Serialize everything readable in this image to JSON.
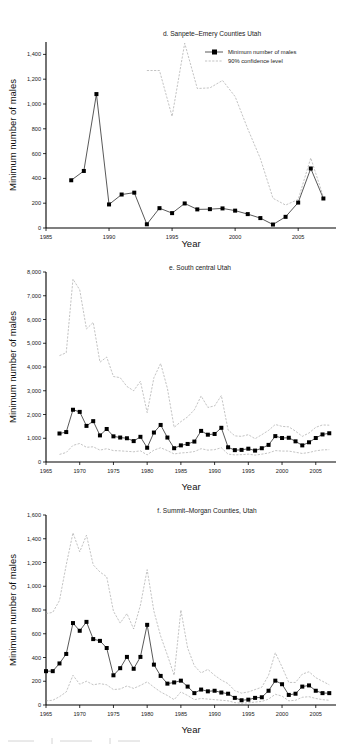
{
  "figure": {
    "panels": [
      "d",
      "e",
      "f"
    ],
    "shared_axis_label_x": "Year",
    "shared_axis_label_y": "Minimum number of males",
    "legend": {
      "series_label": "Minimum number of males",
      "ci_label": "90% confidence level"
    },
    "colors": {
      "series": "#111111",
      "confidence": "#9a9a9a",
      "axis": "#000000",
      "background": "#ffffff"
    }
  },
  "chart_data": [
    {
      "id": "panel-d",
      "type": "line",
      "title": "d. Sanpete–Emery Counties Utah",
      "xlabel": "Year",
      "ylabel": "Minimum number of males",
      "xlim": [
        1985,
        2008
      ],
      "ylim": [
        0,
        1500
      ],
      "xticks": [
        1985,
        1990,
        1995,
        2000,
        2005
      ],
      "xtick_labels": [
        "1985",
        "1990",
        "1995",
        "2000",
        "2005"
      ],
      "yticks": [
        0,
        200,
        400,
        600,
        800,
        1000,
        1200,
        1400
      ],
      "ytick_labels": [
        "0",
        "200",
        "400",
        "600",
        "800",
        "1,000",
        "1,200",
        "1,400"
      ],
      "grid": false,
      "legend_position": "top-right",
      "x": [
        1987,
        1988,
        1989,
        1990,
        1991,
        1992,
        1993,
        1994,
        1995,
        1996,
        1997,
        1998,
        1999,
        2000,
        2001,
        2002,
        2003,
        2004,
        2005,
        2006,
        2007
      ],
      "series": [
        {
          "name": "Minimum number of males",
          "style": "line-marker",
          "values": [
            385,
            460,
            1080,
            190,
            270,
            285,
            30,
            160,
            120,
            198,
            150,
            152,
            158,
            140,
            112,
            80,
            28,
            90,
            205,
            480,
            238
          ]
        },
        {
          "name": "90% confidence level",
          "style": "dashed",
          "x": [
            1993,
            1994,
            1995,
            1996,
            1997,
            1998,
            1999,
            2000,
            2001,
            2002,
            2003,
            2004,
            2005,
            2006,
            2007
          ],
          "values": [
            1270,
            1270,
            900,
            1490,
            1125,
            1130,
            1190,
            1060,
            800,
            560,
            240,
            185,
            230,
            565,
            250
          ]
        }
      ]
    },
    {
      "id": "panel-e",
      "type": "line",
      "title": "e. South central Utah",
      "xlabel": "Year",
      "ylabel": "Minimum number of males",
      "xlim": [
        1965,
        2008
      ],
      "ylim": [
        0,
        8000
      ],
      "xticks": [
        1965,
        1970,
        1975,
        1980,
        1985,
        1990,
        1995,
        2000,
        2005
      ],
      "xtick_labels": [
        "1965",
        "1970",
        "1975",
        "1980",
        "1985",
        "1990",
        "1995",
        "2000",
        "2005"
      ],
      "yticks": [
        0,
        1000,
        2000,
        3000,
        4000,
        5000,
        6000,
        7000,
        8000
      ],
      "ytick_labels": [
        "0",
        "1,000",
        "2,000",
        "3,000",
        "4,000",
        "5,000",
        "6,000",
        "7,000",
        "8,000"
      ],
      "grid": false,
      "legend_position": "none",
      "x": [
        1967,
        1968,
        1969,
        1970,
        1971,
        1972,
        1973,
        1974,
        1975,
        1976,
        1977,
        1978,
        1979,
        1980,
        1981,
        1982,
        1983,
        1984,
        1985,
        1986,
        1987,
        1988,
        1989,
        1990,
        1991,
        1992,
        1993,
        1994,
        1995,
        1996,
        1997,
        1998,
        1999,
        2000,
        2001,
        2002,
        2003,
        2004,
        2005,
        2006,
        2007
      ],
      "series": [
        {
          "name": "Minimum number of males",
          "style": "line-marker",
          "values": [
            1200,
            1260,
            2200,
            2110,
            1520,
            1720,
            1120,
            1390,
            1080,
            1030,
            1000,
            880,
            1060,
            600,
            1240,
            1560,
            1030,
            580,
            700,
            760,
            860,
            1310,
            1150,
            1180,
            1440,
            620,
            500,
            510,
            560,
            480,
            580,
            720,
            1090,
            1010,
            1020,
            870,
            700,
            830,
            1010,
            1160,
            1210
          ]
        },
        {
          "name": "90% confidence level upper",
          "style": "dashed",
          "x": [
            1967,
            1968,
            1969,
            1970,
            1971,
            1972,
            1973,
            1974,
            1975,
            1976,
            1977,
            1978,
            1979,
            1980,
            1981,
            1982,
            1983,
            1984,
            1985,
            1986,
            1987,
            1988,
            1989,
            1990,
            1991,
            1992,
            1993,
            1994,
            1995,
            1996,
            1997,
            1998,
            1999,
            2000,
            2001,
            2002,
            2003,
            2004,
            2005,
            2006,
            2007
          ],
          "values": [
            4480,
            4600,
            7700,
            7250,
            5600,
            5880,
            4200,
            4420,
            3600,
            3550,
            3180,
            3000,
            3400,
            2080,
            3550,
            4150,
            3100,
            1460,
            1700,
            1900,
            2200,
            2780,
            2300,
            2360,
            2800,
            1350,
            1100,
            1080,
            1150,
            980,
            1150,
            1330,
            1580,
            1500,
            1480,
            1300,
            1080,
            1220,
            1460,
            1560,
            1550
          ]
        },
        {
          "name": "90% confidence level lower",
          "style": "dashed",
          "x": [
            1967,
            1968,
            1969,
            1970,
            1971,
            1972,
            1973,
            1974,
            1975,
            1976,
            1977,
            1978,
            1979,
            1980,
            1981,
            1982,
            1983,
            1984,
            1985,
            1986,
            1987,
            1988,
            1989,
            1990,
            1991,
            1992,
            1993,
            1994,
            1995,
            1996,
            1997,
            1998,
            1999,
            2000,
            2001,
            2002,
            2003,
            2004,
            2005,
            2006,
            2007
          ],
          "values": [
            320,
            400,
            700,
            780,
            620,
            640,
            500,
            560,
            480,
            470,
            450,
            430,
            470,
            300,
            500,
            600,
            480,
            340,
            380,
            400,
            440,
            560,
            500,
            520,
            600,
            330,
            300,
            310,
            330,
            290,
            330,
            380,
            480,
            460,
            460,
            410,
            360,
            400,
            470,
            510,
            520
          ]
        }
      ]
    },
    {
      "id": "panel-f",
      "type": "line",
      "title": "f. Summit–Morgan Counties, Utah",
      "xlabel": "Year",
      "ylabel": "Minimum number of males",
      "xlim": [
        1965,
        2008
      ],
      "ylim": [
        0,
        1600
      ],
      "xticks": [
        1965,
        1970,
        1975,
        1980,
        1985,
        1990,
        1995,
        2000,
        2005
      ],
      "xtick_labels": [
        "1965",
        "1970",
        "1975",
        "1980",
        "1985",
        "1990",
        "1995",
        "2000",
        "2005"
      ],
      "yticks": [
        0,
        200,
        400,
        600,
        800,
        1000,
        1200,
        1400,
        1600
      ],
      "ytick_labels": [
        "0",
        "200",
        "400",
        "600",
        "800",
        "1,000",
        "1,200",
        "1,400",
        "1,600"
      ],
      "grid": false,
      "legend_position": "none",
      "x": [
        1965,
        1966,
        1967,
        1968,
        1969,
        1970,
        1971,
        1972,
        1973,
        1974,
        1975,
        1976,
        1977,
        1978,
        1979,
        1980,
        1981,
        1982,
        1983,
        1984,
        1985,
        1986,
        1987,
        1988,
        1989,
        1990,
        1991,
        1992,
        1993,
        1994,
        1995,
        1996,
        1997,
        1998,
        1999,
        2000,
        2001,
        2002,
        2003,
        2004,
        2005,
        2006,
        2007
      ],
      "series": [
        {
          "name": "Minimum number of males",
          "style": "line-marker",
          "values": [
            285,
            285,
            350,
            430,
            690,
            625,
            700,
            555,
            540,
            480,
            250,
            310,
            405,
            305,
            405,
            675,
            340,
            245,
            180,
            190,
            205,
            155,
            100,
            130,
            115,
            120,
            105,
            95,
            60,
            40,
            45,
            60,
            65,
            120,
            205,
            175,
            85,
            95,
            155,
            165,
            120,
            100,
            100
          ]
        },
        {
          "name": "90% confidence level upper",
          "style": "dashed",
          "x": [
            1965,
            1966,
            1967,
            1968,
            1969,
            1970,
            1971,
            1972,
            1973,
            1974,
            1975,
            1976,
            1977,
            1978,
            1979,
            1980,
            1981,
            1982,
            1983,
            1984,
            1985,
            1986,
            1987,
            1988,
            1989,
            1990,
            1991,
            1992,
            1993,
            1994,
            1995,
            1996,
            1997,
            1998,
            1999,
            2000,
            2001,
            2002,
            2003,
            2004,
            2005,
            2006,
            2007
          ],
          "values": [
            770,
            780,
            880,
            1180,
            1450,
            1290,
            1430,
            1180,
            1120,
            1080,
            790,
            690,
            770,
            640,
            840,
            1140,
            790,
            580,
            420,
            250,
            800,
            480,
            330,
            270,
            300,
            250,
            210,
            180,
            120,
            100,
            110,
            130,
            150,
            250,
            440,
            320,
            190,
            190,
            260,
            280,
            230,
            200,
            170
          ]
        },
        {
          "name": "90% confidence level lower",
          "style": "dashed",
          "x": [
            1965,
            1966,
            1967,
            1968,
            1969,
            1970,
            1971,
            1972,
            1973,
            1974,
            1975,
            1976,
            1977,
            1978,
            1979,
            1980,
            1981,
            1982,
            1983,
            1984,
            1985,
            1986,
            1987,
            1988,
            1989,
            1990,
            1991,
            1992,
            1993,
            1994,
            1995,
            1996,
            1997,
            1998,
            1999,
            2000,
            2001,
            2002,
            2003,
            2004,
            2005,
            2006,
            2007
          ],
          "values": [
            35,
            40,
            70,
            110,
            250,
            175,
            200,
            170,
            180,
            170,
            130,
            135,
            160,
            140,
            165,
            195,
            150,
            110,
            80,
            45,
            110,
            80,
            45,
            55,
            50,
            45,
            40,
            35,
            20,
            15,
            18,
            25,
            30,
            50,
            90,
            75,
            35,
            40,
            65,
            70,
            55,
            45,
            40
          ]
        }
      ]
    }
  ]
}
